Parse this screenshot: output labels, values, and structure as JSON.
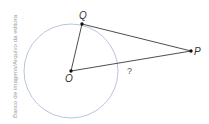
{
  "diagram": {
    "type": "geometry-tangent",
    "credit": "Banco de imagens/Arquivo da editora",
    "circle": {
      "center": "O",
      "color": "#b9c6dc"
    },
    "points": [
      {
        "name": "Q",
        "label": "Q",
        "x": 82,
        "y": 24
      },
      {
        "name": "O",
        "label": "O",
        "x": 71,
        "y": 71
      },
      {
        "name": "P",
        "label": "P",
        "x": 191,
        "y": 51
      }
    ],
    "segments": [
      {
        "from": "O",
        "to": "Q"
      },
      {
        "from": "Q",
        "to": "P"
      },
      {
        "from": "O",
        "to": "P",
        "label": "?"
      }
    ],
    "unknown_label": "?",
    "line_color": "#3a3a3a"
  }
}
